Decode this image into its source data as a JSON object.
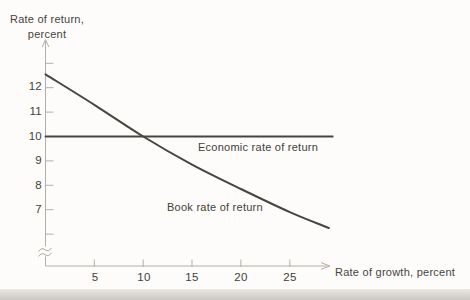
{
  "labels": {
    "y_axis_title_line1": "Rate of return,",
    "y_axis_title_line2": "percent",
    "x_axis_title": "Rate of growth, percent"
  },
  "chart_data": {
    "type": "line",
    "title": "",
    "xlabel": "Rate of growth, percent",
    "ylabel": "Rate of return, percent",
    "xlim": [
      0,
      30
    ],
    "ylim": [
      6,
      13.5
    ],
    "y_axis_break": true,
    "grid": false,
    "legend_position": "inline-annotations",
    "x_ticks": [
      5,
      10,
      15,
      20,
      25
    ],
    "x_tick_labels": [
      "5",
      "10",
      "15",
      "20",
      "25"
    ],
    "y_ticks": [
      6,
      7,
      8,
      9,
      10,
      11,
      12,
      13
    ],
    "y_tick_labels": [
      "12",
      "11",
      "10",
      "9",
      "8",
      "7"
    ],
    "series": [
      {
        "name": "Economic rate of return",
        "x": [
          0,
          29.4
        ],
        "y": [
          10,
          10
        ]
      },
      {
        "name": "Book rate of return",
        "x": [
          0,
          5,
          10,
          15,
          20,
          25,
          29
        ],
        "y": [
          12.55,
          11.3,
          10.0,
          8.85,
          7.85,
          6.9,
          6.25
        ]
      }
    ],
    "annotations": [
      {
        "text": "Economic rate of return",
        "x": 15.6,
        "y": 9.5
      },
      {
        "text": "Book rate of return",
        "x": 12.5,
        "y": 7.2
      }
    ],
    "colors": {
      "curve": "#454540",
      "axis": "#b2afa7",
      "text": "#45443e"
    }
  }
}
